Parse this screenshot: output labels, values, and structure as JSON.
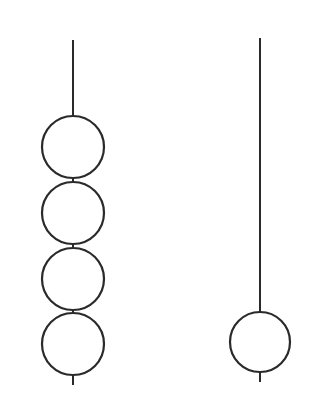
{
  "diagram": {
    "stroke_color": "#2a2a2a",
    "background": "#ffffff",
    "left_string": {
      "line_x": 73,
      "line_top": 40,
      "line_bottom": 385,
      "bead_radius": 31,
      "bead_centers_y": [
        147,
        213,
        279,
        344
      ],
      "bead_count": 4
    },
    "right_string": {
      "line_x": 260,
      "line_top": 38,
      "line_bottom": 382,
      "bead_radius": 30,
      "bead_centers_y": [
        342
      ],
      "bead_count": 1
    }
  }
}
